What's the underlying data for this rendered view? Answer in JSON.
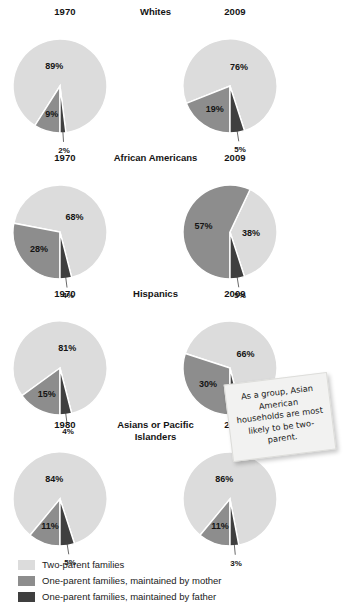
{
  "colors": {
    "two_parent": "#dcdcdc",
    "mother": "#8d8d8d",
    "father": "#3f3f3f",
    "background": "#ffffff",
    "text": "#1a1a1a",
    "note_bg": "#f2f2f1"
  },
  "legend": {
    "items": [
      {
        "label": "Two-parent families",
        "color": "#dcdcdc",
        "key": "two_parent"
      },
      {
        "label": "One-parent families, maintained by mother",
        "color": "#8d8d8d",
        "key": "mother"
      },
      {
        "label": "One-parent families, maintained by father",
        "color": "#3f3f3f",
        "key": "father"
      }
    ]
  },
  "callout": {
    "text": "As a group, Asian American households are most likely to be two-parent."
  },
  "chart_data": {
    "type": "pie",
    "title": "",
    "series_labels": [
      "Two-parent families",
      "One-parent families, maintained by mother",
      "One-parent families, maintained by father"
    ],
    "groups": [
      {
        "name": "Whites",
        "charts": [
          {
            "year": "1970",
            "values": [
              89,
              9,
              2
            ],
            "labels": [
              "89%",
              "9%",
              "2%"
            ]
          },
          {
            "year": "2009",
            "values": [
              76,
              19,
              5
            ],
            "labels": [
              "76%",
              "19%",
              "5%"
            ]
          }
        ]
      },
      {
        "name": "African Americans",
        "charts": [
          {
            "year": "1970",
            "values": [
              68,
              28,
              4
            ],
            "labels": [
              "68%",
              "28%",
              "4%"
            ]
          },
          {
            "year": "2009",
            "values": [
              38,
              57,
              5
            ],
            "labels": [
              "38%",
              "57%",
              "5%"
            ]
          }
        ]
      },
      {
        "name": "Hispanics",
        "charts": [
          {
            "year": "1970",
            "values": [
              81,
              15,
              4
            ],
            "labels": [
              "81%",
              "15%",
              "4%"
            ]
          },
          {
            "year": "2009",
            "values": [
              66,
              30,
              4
            ],
            "labels": [
              "66%",
              "30%",
              "4%"
            ]
          }
        ]
      },
      {
        "name": "Asians or Pacific Islanders",
        "charts": [
          {
            "year": "1980",
            "values": [
              84,
              11,
              5
            ],
            "labels": [
              "84%",
              "11%",
              "5%"
            ]
          },
          {
            "year": "2009",
            "values": [
              86,
              11,
              3
            ],
            "labels": [
              "86%",
              "11%",
              "3%"
            ]
          }
        ]
      }
    ]
  },
  "layout": {
    "group_tops": [
      6,
      152,
      288,
      419
    ],
    "pie_radius": 47,
    "pie_small_radius": 44
  }
}
